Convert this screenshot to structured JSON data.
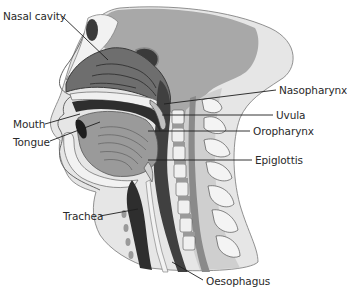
{
  "diagram": {
    "colors": {
      "skin_shadow": "#a9a9a9",
      "skin_light": "#e3e3e3",
      "bone": "#f0f0f0",
      "dark_cavity": "#3c3c3c",
      "tissue_mid": "#8c8c8c",
      "outline": "#4a4a4a",
      "leader_line": "#1e1e1e",
      "label_text": "#2a2a2a"
    },
    "labels": [
      {
        "id": "nasal-cavity",
        "text": "Nasal cavity",
        "side": "left"
      },
      {
        "id": "mouth",
        "text": "Mouth",
        "side": "left"
      },
      {
        "id": "tongue",
        "text": "Tongue",
        "side": "left"
      },
      {
        "id": "trachea",
        "text": "Trachea",
        "side": "left"
      },
      {
        "id": "nasopharynx",
        "text": "Nasopharynx",
        "side": "right"
      },
      {
        "id": "uvula",
        "text": "Uvula",
        "side": "right"
      },
      {
        "id": "oropharynx",
        "text": "Oropharynx",
        "side": "right"
      },
      {
        "id": "epiglottis",
        "text": "Epiglottis",
        "side": "right"
      },
      {
        "id": "oesophagus",
        "text": "Oesophagus",
        "side": "bottom"
      }
    ]
  }
}
